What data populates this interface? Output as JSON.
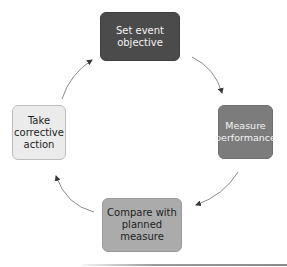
{
  "diagram": {
    "type": "cycle",
    "direction": "clockwise",
    "nodes": [
      {
        "id": "set-objective",
        "label": "Set event\nobjective",
        "position": "top",
        "fill": "#4b4b4b",
        "text_color": "#f2f2f2"
      },
      {
        "id": "measure-performance",
        "label": "Measure\nperformance",
        "position": "right",
        "fill": "#7c7c7c",
        "text_color": "#f4f4f4"
      },
      {
        "id": "compare-planned",
        "label": "Compare with\nplanned\nmeasure",
        "position": "bottom",
        "fill": "#ababab",
        "text_color": "#1e1e1e"
      },
      {
        "id": "corrective-action",
        "label": "Take\ncorrective\naction",
        "position": "left",
        "fill": "#ebebeb",
        "text_color": "#1e1e1e"
      }
    ],
    "edges": [
      {
        "from": "set-objective",
        "to": "measure-performance"
      },
      {
        "from": "measure-performance",
        "to": "compare-planned"
      },
      {
        "from": "compare-planned",
        "to": "corrective-action"
      },
      {
        "from": "corrective-action",
        "to": "set-objective"
      }
    ],
    "arrow_color": "#8a8a8a"
  }
}
